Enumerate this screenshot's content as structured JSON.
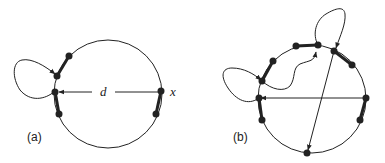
{
  "figure": {
    "panel_a": {
      "label": "(a)",
      "distance_label": "d",
      "vertex_label": "x",
      "circle": {
        "cx": 108,
        "cy": 94,
        "r": 54
      }
    },
    "panel_b": {
      "label": "(b)",
      "circle": {
        "cx": 312,
        "cy": 99,
        "r": 54
      }
    },
    "colors": {
      "stroke": "#222222",
      "background": "#ffffff"
    }
  }
}
